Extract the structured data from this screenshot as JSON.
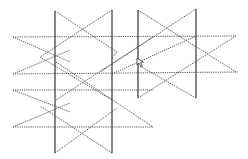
{
  "figure": {
    "width": 248,
    "height": 159,
    "background": "#ffffff",
    "stroke_color": "#555555",
    "solid_color": "#444444",
    "solid_lines": [
      {
        "x1": 55,
        "y1": 11,
        "x2": 55,
        "y2": 153
      },
      {
        "x1": 112,
        "y1": 10,
        "x2": 112,
        "y2": 153
      },
      {
        "x1": 138,
        "y1": 10,
        "x2": 138,
        "y2": 98
      },
      {
        "x1": 196,
        "y1": 9,
        "x2": 196,
        "y2": 98
      }
    ],
    "dotted_lines": [
      {
        "x1": 13,
        "y1": 37,
        "x2": 236,
        "y2": 36
      },
      {
        "x1": 13,
        "y1": 74,
        "x2": 238,
        "y2": 72
      },
      {
        "x1": 13,
        "y1": 90,
        "x2": 153,
        "y2": 90
      },
      {
        "x1": 13,
        "y1": 127,
        "x2": 153,
        "y2": 127
      },
      {
        "x1": 13,
        "y1": 37,
        "x2": 70,
        "y2": 62
      },
      {
        "x1": 13,
        "y1": 74,
        "x2": 70,
        "y2": 50
      },
      {
        "x1": 13,
        "y1": 90,
        "x2": 70,
        "y2": 112
      },
      {
        "x1": 13,
        "y1": 127,
        "x2": 70,
        "y2": 103
      },
      {
        "x1": 55,
        "y1": 11,
        "x2": 117,
        "y2": 52
      },
      {
        "x1": 112,
        "y1": 10,
        "x2": 40,
        "y2": 57
      },
      {
        "x1": 55,
        "y1": 153,
        "x2": 117,
        "y2": 108
      },
      {
        "x1": 112,
        "y1": 153,
        "x2": 40,
        "y2": 106
      },
      {
        "x1": 117,
        "y1": 52,
        "x2": 112,
        "y2": 58
      },
      {
        "x1": 56,
        "y1": 62,
        "x2": 153,
        "y2": 127
      },
      {
        "x1": 56,
        "y1": 100,
        "x2": 153,
        "y2": 37
      },
      {
        "x1": 40,
        "y1": 57,
        "x2": 112,
        "y2": 100
      },
      {
        "x1": 138,
        "y1": 10,
        "x2": 236,
        "y2": 72
      },
      {
        "x1": 196,
        "y1": 9,
        "x2": 100,
        "y2": 72
      },
      {
        "x1": 138,
        "y1": 98,
        "x2": 236,
        "y2": 36
      },
      {
        "x1": 196,
        "y1": 98,
        "x2": 140,
        "y2": 66
      },
      {
        "x1": 112,
        "y1": 74,
        "x2": 196,
        "y2": 36
      }
    ],
    "cursor": {
      "x": 137,
      "y": 58,
      "icon": "cursor-arrow-icon"
    }
  }
}
